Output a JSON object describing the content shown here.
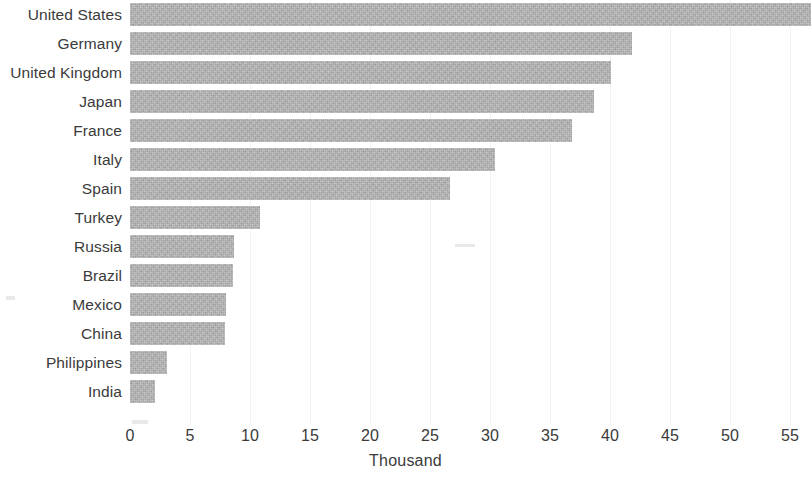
{
  "chart_data": {
    "type": "bar",
    "orientation": "horizontal",
    "title": "",
    "xlabel": "Thousand",
    "ylabel": "",
    "categories": [
      "United States",
      "Germany",
      "United Kingdom",
      "Japan",
      "France",
      "Italy",
      "Spain",
      "Turkey",
      "Russia",
      "Brazil",
      "Mexico",
      "China",
      "Philippines",
      "India"
    ],
    "values": [
      56.8,
      41.8,
      40.1,
      38.7,
      36.8,
      30.4,
      26.7,
      10.8,
      8.7,
      8.6,
      8.0,
      7.9,
      3.1,
      2.1
    ],
    "xticks": [
      0,
      5,
      10,
      15,
      20,
      25,
      30,
      35,
      40,
      45,
      50,
      55
    ],
    "xlim": [
      0,
      56.8
    ],
    "grid": true,
    "legend": false,
    "bar_color": "#b2b2b2"
  },
  "axis": {
    "title": "Thousand"
  }
}
